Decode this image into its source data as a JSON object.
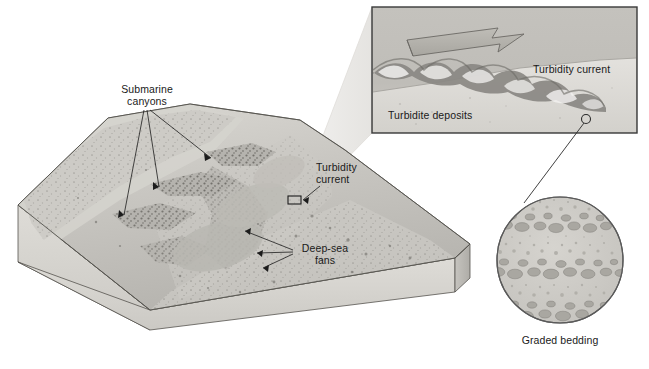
{
  "figure": {
    "background_color": "#ffffff"
  },
  "palette": {
    "ink": "#1a1a1a",
    "block_top_light": "#d9d7d2",
    "block_top_mid": "#c2c0ba",
    "block_top_dark": "#8e8c87",
    "block_front": "#d2d0ca",
    "block_side": "#bebcb6",
    "block_outline": "#4a4a4a",
    "inset_fill": "#c8c6c1",
    "inset_border": "#3a3a3a",
    "cone_fill": "#e4e3e0",
    "arrow_fill": "#b5b3ad",
    "arrow_stroke": "#6b6964",
    "circle_fill": "#cfcdc8",
    "circle_stroke": "#5a5a5a",
    "grain_fill": "#b0aea9",
    "leader_line": "#2b2b2b",
    "canyon_dark": "#575550",
    "fan_fill": "#b9b7b1",
    "water_light": "#e8e7e4"
  },
  "block_diagram": {
    "name": "seafloor-block-diagram",
    "labels": [
      {
        "id": "submarine-canyons",
        "text": "Submarine\ncanyons",
        "x": 104,
        "y": 84,
        "width": 86,
        "align": "center",
        "leader_targets": [
          {
            "x": 211,
            "y": 158
          },
          {
            "x": 159,
            "y": 187
          },
          {
            "x": 124,
            "y": 215
          }
        ],
        "leader_origin": {
          "x": 150,
          "y": 110
        }
      },
      {
        "id": "turbidity-current-block",
        "text": "Turbidity\ncurrent",
        "x": 316,
        "y": 162,
        "width": 62,
        "align": "left",
        "leader_targets": [
          {
            "x": 300,
            "y": 201
          }
        ],
        "leader_origin": {
          "x": 322,
          "y": 186
        }
      },
      {
        "id": "deep-sea-fans",
        "text": "Deep-sea\nfans",
        "x": 295,
        "y": 243,
        "width": 58,
        "align": "left",
        "leader_targets": [
          {
            "x": 245,
            "y": 231
          },
          {
            "x": 257,
            "y": 253
          },
          {
            "x": 263,
            "y": 268
          }
        ],
        "leader_origin": {
          "x": 293,
          "y": 252
        }
      }
    ],
    "zoom_marker": {
      "x": 288,
      "y": 196,
      "width": 13,
      "height": 8
    }
  },
  "inset_panel": {
    "name": "turbidity-current-inset",
    "x": 372,
    "y": 7,
    "width": 265,
    "height": 126,
    "labels": [
      {
        "id": "turbidity-current-inset-label",
        "text": "Turbidity current",
        "x": 533,
        "y": 66,
        "align": "left"
      },
      {
        "id": "turbidite-deposits-label",
        "text": "Turbidite deposits",
        "x": 388,
        "y": 112,
        "align": "left"
      }
    ],
    "flow_arrow": {
      "id": "flow-direction-arrow",
      "direction": "right",
      "x": 405,
      "y": 28,
      "width": 120,
      "height": 32
    },
    "sample_marker": {
      "x": 586,
      "y": 119,
      "radius": 4.5
    }
  },
  "graded_bedding_inset": {
    "name": "graded-bedding-inset",
    "center_x": 560,
    "center_y": 260,
    "radius": 64,
    "label": {
      "id": "graded-bedding-label",
      "text": "Graded bedding",
      "x": 560,
      "y": 337
    },
    "bed_count": 3,
    "bed_description": "Three fining-upward graded beds: coarse clasts at base grading to fine sand at top"
  },
  "leader_lines": {
    "bedding_connector": {
      "from": {
        "x": 586,
        "y": 122
      },
      "to": {
        "x": 524,
        "y": 203
      }
    }
  },
  "zoom_cone": {
    "name": "zoom-cone-to-inset",
    "from_top": {
      "x": 300,
      "y": 196
    },
    "from_bottom": {
      "x": 301,
      "y": 205
    },
    "to_top": {
      "x": 372,
      "y": 7
    },
    "to_bottom": {
      "x": 372,
      "y": 133
    }
  }
}
